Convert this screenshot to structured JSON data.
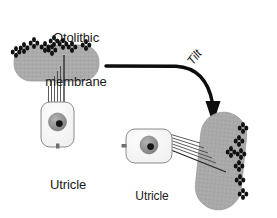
{
  "figure": {
    "background": "#ffffff"
  },
  "colors": {
    "membrane_gray": "#ababab",
    "membrane_gray_dark": "#9a9a9a",
    "membrane_edge": "#8a8a8a",
    "cell_fill": "#f7f7f7",
    "cell_edge": "#7d7d7d",
    "nucleus_gray": "#8f8f8f",
    "nucleolus": "#151515",
    "otoconia": "#111111",
    "arrow": "#0d0d0d",
    "text": "#1a1a1a",
    "cilia": "#3a3a3a"
  },
  "labels": {
    "otolithic_membrane": {
      "line1": "Otolithic",
      "line2": "membrane"
    },
    "utricle_upright": {
      "line1": "Utricle",
      "line2": "upright"
    },
    "utricle_tilted": {
      "line1": "Utricle",
      "line2": "tilted"
    },
    "tilt_arrow": "Tilt"
  },
  "panels": {
    "upright": {
      "name": "utricle-upright-panel",
      "membrane": {
        "x": 14,
        "y": 45,
        "width": 85,
        "height": 36,
        "rx": 17,
        "fill": "#ababab"
      },
      "otoconia_count": 9,
      "hair_cell": {
        "x": 41,
        "y": 102,
        "width": 33,
        "height": 45,
        "rx": 9
      },
      "nucleus": {
        "cx": 57.5,
        "cy": 122,
        "r": 9
      },
      "nucleolus": {
        "cx": 59.5,
        "cy": 123.5,
        "r": 3.4
      },
      "stereocilia_count": 6
    },
    "tilted": {
      "name": "utricle-tilted-panel",
      "membrane": {
        "x": 198,
        "y": 112,
        "width": 46,
        "height": 98,
        "rx": 23,
        "fill": "#ababab"
      },
      "otoconia_count": 7,
      "hair_cell": {
        "x": 126,
        "y": 129,
        "width": 46,
        "height": 34,
        "rx": 9
      },
      "nucleus": {
        "cx": 149,
        "cy": 145,
        "r": 9
      },
      "nucleolus": {
        "cx": 150.5,
        "cy": 146.5,
        "r": 3.4
      },
      "stereocilia_count": 6
    }
  },
  "arrow": {
    "name": "tilt-arrow",
    "path": "M 106 66 L 176 66 Q 207 67 213 102",
    "head": {
      "tip_x": 213,
      "tip_y": 123,
      "width": 15,
      "height": 21
    },
    "stroke_width": 3.2
  },
  "otoconia_shape": {
    "description": "cluster of four small black diamonds",
    "diamond_rx": 2.0,
    "diamond_ry": 2.5,
    "offset": 3.2
  }
}
